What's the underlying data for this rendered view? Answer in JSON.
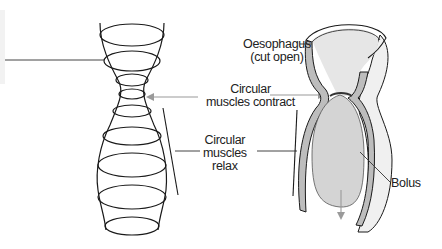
{
  "diagram": {
    "labels": {
      "oesophagus_line1": "Oesophagus",
      "oesophagus_line2": "(cut open)",
      "contract_line1": "Circular",
      "contract_line2": "muscles contract",
      "relax_line1": "Circular",
      "relax_line2": "muscles",
      "relax_line3": "relax",
      "bolus": "Bolus"
    },
    "colors": {
      "line": "#1a1a1a",
      "arrow": "#9a9a9a",
      "wall": "#bdbdbd",
      "bolus": "#d4d4d4",
      "inner": "#ededed"
    }
  }
}
